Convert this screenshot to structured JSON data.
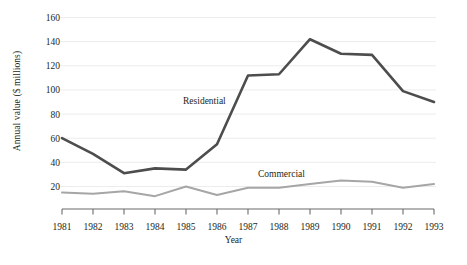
{
  "chart_data": {
    "type": "line",
    "title": "",
    "xlabel": "Year",
    "ylabel": "Annual value ($ millions)",
    "x": [
      1981,
      1982,
      1983,
      1984,
      1985,
      1986,
      1987,
      1988,
      1989,
      1990,
      1991,
      1992,
      1993
    ],
    "xticklabels": [
      "1981",
      "1982",
      "1983",
      "1984",
      "1985",
      "1986",
      "1987",
      "1988",
      "1989",
      "1990",
      "1991",
      "1992",
      "1993"
    ],
    "yticklabels": [
      "20",
      "40",
      "60",
      "80",
      "100",
      "120",
      "140",
      "160"
    ],
    "yticks": [
      20,
      40,
      60,
      80,
      100,
      120,
      140,
      160
    ],
    "ylim": [
      0,
      168
    ],
    "xlim": [
      1981,
      1993
    ],
    "grid": "horizontal",
    "legend": "inline-annotations",
    "series": [
      {
        "name": "Residential",
        "color": "#4d4d4d",
        "linewidth": 2.6,
        "label_position": {
          "x": 183,
          "y": 101
        },
        "values": [
          60,
          47,
          31,
          35,
          34,
          55,
          112,
          113,
          142,
          130,
          129,
          99,
          90
        ]
      },
      {
        "name": "Commercial",
        "color": "#a6a6a6",
        "linewidth": 2.0,
        "label_position": {
          "x": 258,
          "y": 174
        },
        "values": [
          15,
          14,
          16,
          12,
          20,
          13,
          19,
          19,
          22,
          25,
          24,
          19,
          22
        ]
      }
    ],
    "annotations": [
      {
        "text": "Residential",
        "x": 1985.3,
        "y": 84
      },
      {
        "text": "Commercial",
        "x": 1988.6,
        "y": 33
      }
    ]
  },
  "axes": {
    "y_title": "Annual value ($ millions)",
    "x_title": "Year"
  }
}
